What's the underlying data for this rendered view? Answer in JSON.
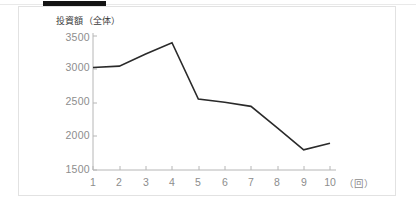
{
  "figure": {
    "top_bar_present": true,
    "card_border_color": "#e2e2e2",
    "line_color": "#2a2a2a",
    "axis_color": "#b6b6b6",
    "tick_text_color": "#8d8d8d"
  },
  "chart_data": {
    "type": "line",
    "title": "",
    "ylabel": "投資額（全体）",
    "xlabel": "",
    "x_unit_label": "（回）",
    "categories": [
      "1",
      "2",
      "3",
      "4",
      "5",
      "6",
      "7",
      "8",
      "9",
      "10"
    ],
    "x": [
      1,
      2,
      3,
      4,
      5,
      6,
      7,
      8,
      9,
      10
    ],
    "values": [
      3030,
      3050,
      3230,
      3400,
      2560,
      2510,
      2450,
      2130,
      1800,
      1900
    ],
    "series": [
      {
        "name": "投資額（全体）",
        "values": [
          3030,
          3050,
          3230,
          3400,
          2560,
          2510,
          2450,
          2130,
          1800,
          1900
        ]
      }
    ],
    "ylim": [
      1500,
      3500
    ],
    "yticks": [
      1500,
      2000,
      2500,
      3000,
      3500
    ],
    "ytick_labels": [
      "1500",
      "2000",
      "2500",
      "3000",
      "3500"
    ],
    "xlim": [
      1,
      10
    ],
    "xticks": [
      1,
      2,
      3,
      4,
      5,
      6,
      7,
      8,
      9,
      10
    ],
    "xtick_labels": [
      "1",
      "2",
      "3",
      "4",
      "5",
      "6",
      "7",
      "8",
      "9",
      "10"
    ],
    "grid": false,
    "legend": false,
    "markers": false
  }
}
